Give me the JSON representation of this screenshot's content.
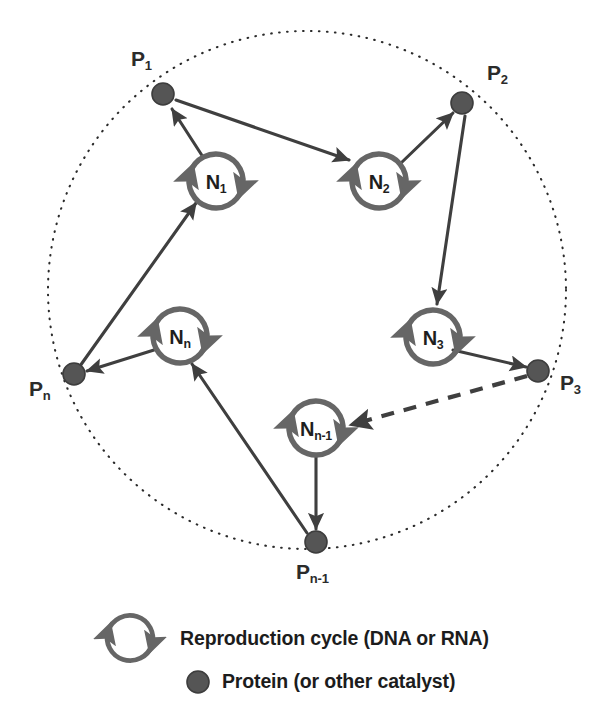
{
  "figure": {
    "colors": {
      "protein_fill": "#555555",
      "protein_stroke": "#3d3d3d",
      "cycle_ring": "#666666",
      "arrow": "#3f3f3f",
      "boundary": "#2b2b2b",
      "text": "#1e1e1e",
      "background": "#ffffff"
    },
    "boundary": {
      "shape": "dotted-circle",
      "cx": 307,
      "cy": 290,
      "r": 259
    }
  },
  "proteins": [
    {
      "id": "P1",
      "label_base": "P",
      "label_sub": "1",
      "cx": 163,
      "cy": 94,
      "r": 11,
      "label_x": 131,
      "label_y": 48
    },
    {
      "id": "P2",
      "label_base": "P",
      "label_sub": "2",
      "cx": 462,
      "cy": 103,
      "r": 11,
      "label_x": 487,
      "label_y": 62
    },
    {
      "id": "P3",
      "label_base": "P",
      "label_sub": "3",
      "cx": 538,
      "cy": 371,
      "r": 11,
      "label_x": 560,
      "label_y": 372
    },
    {
      "id": "Pn1",
      "label_base": "P",
      "label_sub": "n-1",
      "cx": 316,
      "cy": 542,
      "r": 11,
      "label_x": 296,
      "label_y": 561
    },
    {
      "id": "Pn",
      "label_base": "P",
      "label_sub": "n",
      "cx": 74,
      "cy": 374,
      "r": 11,
      "label_x": 29,
      "label_y": 378
    }
  ],
  "cycles": [
    {
      "id": "N1",
      "label_base": "N",
      "label_sub": "1",
      "cx": 216,
      "cy": 181,
      "r": 27
    },
    {
      "id": "N2",
      "label_base": "N",
      "label_sub": "2",
      "cx": 379,
      "cy": 181,
      "r": 27
    },
    {
      "id": "N3",
      "label_base": "N",
      "label_sub": "3",
      "cx": 433,
      "cy": 337,
      "r": 27
    },
    {
      "id": "Nn1",
      "label_base": "N",
      "label_sub": "n-1",
      "cx": 316,
      "cy": 428,
      "r": 27
    },
    {
      "id": "Nn",
      "label_base": "N",
      "label_sub": "n",
      "cx": 180,
      "cy": 336,
      "r": 27
    }
  ],
  "arrows": [
    {
      "id": "N1-to-P1",
      "from": "N1",
      "to": "P1",
      "style": "solid",
      "x1": 203,
      "y1": 157,
      "x2": 172,
      "y2": 109
    },
    {
      "id": "P1-to-N2",
      "from": "P1",
      "to": "N2",
      "style": "solid",
      "x1": 176,
      "y1": 100,
      "x2": 349,
      "y2": 160
    },
    {
      "id": "N2-to-P2",
      "from": "N2",
      "to": "P2",
      "style": "solid",
      "x1": 401,
      "y1": 163,
      "x2": 453,
      "y2": 113
    },
    {
      "id": "P2-to-N3",
      "from": "P2",
      "to": "N3",
      "style": "solid",
      "x1": 465,
      "y1": 116,
      "x2": 437,
      "y2": 304
    },
    {
      "id": "N3-to-P3",
      "from": "N3",
      "to": "P3",
      "style": "solid",
      "x1": 453,
      "y1": 350,
      "x2": 526,
      "y2": 367
    },
    {
      "id": "P3-to-Nn1",
      "from": "P3",
      "to": "Nn1",
      "style": "dashed",
      "x1": 527,
      "y1": 376,
      "x2": 350,
      "y2": 425
    },
    {
      "id": "Nn1-to-Pn1",
      "from": "Nn1",
      "to": "Pn1",
      "style": "solid",
      "x1": 316,
      "y1": 457,
      "x2": 316,
      "y2": 529
    },
    {
      "id": "Pn1-to-Nn",
      "from": "Pn1",
      "to": "Nn",
      "style": "solid",
      "x1": 307,
      "y1": 533,
      "x2": 192,
      "y2": 364
    },
    {
      "id": "Nn-to-Pn",
      "from": "Nn",
      "to": "Pn",
      "style": "solid",
      "x1": 154,
      "y1": 350,
      "x2": 87,
      "y2": 371
    },
    {
      "id": "Pn-to-N1",
      "from": "Pn",
      "to": "N1",
      "style": "solid",
      "x1": 80,
      "y1": 366,
      "x2": 196,
      "y2": 203
    }
  ],
  "legend": {
    "items": [
      {
        "id": "legend-cycle",
        "icon": "reproduction-cycle-icon",
        "label": "Reproduction cycle (DNA or RNA)",
        "icon_cx": 130,
        "icon_cy": 638,
        "icon_r": 23,
        "text_x": 180,
        "text_y": 629
      },
      {
        "id": "legend-protein",
        "icon": "protein-dot-icon",
        "label": "Protein (or other catalyst)",
        "icon_cx": 198,
        "icon_cy": 682,
        "icon_r": 11,
        "text_x": 222,
        "text_y": 672
      }
    ]
  }
}
